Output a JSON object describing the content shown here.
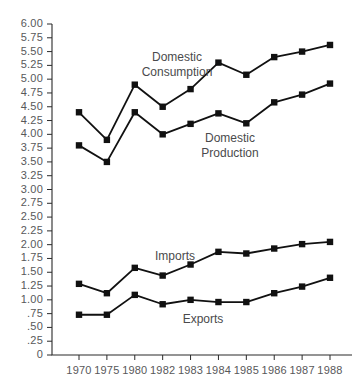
{
  "chart_data": {
    "type": "line",
    "title": "",
    "subtitle": "",
    "xlabel": "",
    "ylabel": "",
    "categories": [
      "1970",
      "1975",
      "1980",
      "1982",
      "1983",
      "1984",
      "1985",
      "1986",
      "1987",
      "1988"
    ],
    "ylim": [
      0,
      6.0
    ],
    "ytick_step": 0.25,
    "ytick_labels": [
      "6.00",
      "5.75",
      "5.50",
      "5.25",
      "5.00",
      "4.75",
      "4.50",
      "4.25",
      "4.00",
      "3.75",
      "3.50",
      "3.25",
      "3.00",
      "2.75",
      "2.50",
      "2.25",
      "2.00",
      "1.75",
      "1.50",
      "1.25",
      "1.00",
      ".75",
      ".50",
      ".25",
      "0"
    ],
    "ytick_values": [
      6.0,
      5.75,
      5.5,
      5.25,
      5.0,
      4.75,
      4.5,
      4.25,
      4.0,
      3.75,
      3.5,
      3.25,
      3.0,
      2.75,
      2.5,
      2.25,
      2.0,
      1.75,
      1.5,
      1.25,
      1.0,
      0.75,
      0.5,
      0.25,
      0
    ],
    "grid": false,
    "legend": "inline-annotations",
    "marker": "filled-square",
    "line_color": "#111111",
    "marker_color": "#111111",
    "series": [
      {
        "name": "Domestic Consumption",
        "label_lines": [
          "Domestic",
          "Consumption"
        ],
        "values": [
          4.4,
          3.9,
          4.9,
          4.5,
          4.82,
          5.3,
          5.08,
          5.4,
          5.5,
          5.62
        ]
      },
      {
        "name": "Domestic Production",
        "label_lines": [
          "Domestic",
          "Production"
        ],
        "values": [
          3.8,
          3.5,
          4.4,
          4.0,
          4.19,
          4.38,
          4.2,
          4.58,
          4.72,
          4.92
        ]
      },
      {
        "name": "Imports",
        "label_lines": [
          "Imports"
        ],
        "values": [
          1.29,
          1.12,
          1.58,
          1.44,
          1.64,
          1.87,
          1.84,
          1.93,
          2.01,
          2.05
        ]
      },
      {
        "name": "Exports",
        "label_lines": [
          "Exports"
        ],
        "values": [
          0.73,
          0.73,
          1.09,
          0.92,
          1.0,
          0.96,
          0.96,
          1.12,
          1.24,
          1.4
        ]
      }
    ],
    "annotations": [
      {
        "text_lines": [
          "Domestic",
          "Consumption"
        ],
        "x": 177,
        "y": 50
      },
      {
        "text_lines": [
          "Domestic",
          "Production"
        ],
        "x": 230,
        "y": 131
      },
      {
        "text_lines": [
          "Imports"
        ],
        "x": 175,
        "y": 249
      },
      {
        "text_lines": [
          "Exports"
        ],
        "x": 203,
        "y": 312
      }
    ]
  }
}
